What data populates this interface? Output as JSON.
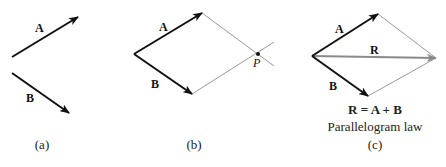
{
  "figure": {
    "panels": [
      {
        "id": "a",
        "caption": "(a)",
        "vectors": [
          {
            "label": "A",
            "from": [
              12,
              57
            ],
            "to": [
              78,
              17
            ]
          },
          {
            "label": "B",
            "from": [
              12,
              73
            ],
            "to": [
              69,
              113
            ]
          }
        ]
      },
      {
        "id": "b",
        "caption": "(b)",
        "vectors": [
          {
            "label": "A",
            "from": [
              134,
              54
            ],
            "to": [
              202,
              13
            ]
          },
          {
            "label": "B",
            "from": [
              134,
              54
            ],
            "to": [
              192,
              94
            ]
          }
        ],
        "point_label": "P"
      },
      {
        "id": "c",
        "caption": "(c)",
        "vectors": [
          {
            "label": "A",
            "from": [
              312,
              56
            ],
            "to": [
              378,
              14
            ]
          },
          {
            "label": "B",
            "from": [
              312,
              56
            ],
            "to": [
              368,
              96
            ]
          },
          {
            "label": "R",
            "from": [
              312,
              56
            ],
            "to": [
              436,
              58
            ]
          }
        ],
        "equation": "R = A + B",
        "law": "Parallelogram law"
      }
    ],
    "colors": {
      "vector": "#111111",
      "construction_line": "#9a9a9a",
      "resultant": "#8a8a8a"
    }
  }
}
